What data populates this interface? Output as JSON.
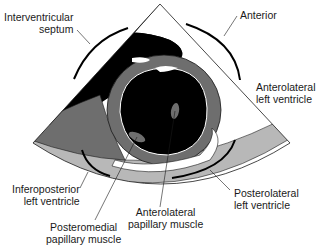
{
  "figure": {
    "type": "echocardiographic short-axis view of left ventricle at papillary muscle level",
    "labels": {
      "interventricular_septum_1": "Interventricular",
      "interventricular_septum_2": "septum",
      "anterior": "Anterior",
      "anterolateral_lv_1": "Anterolateral",
      "anterolateral_lv_2": "left ventricle",
      "inferoposterior_lv_1": "Inferoposterior",
      "inferoposterior_lv_2": "left ventricle",
      "posterolateral_lv_1": "Posterolateral",
      "posterolateral_lv_2": "left ventricle",
      "posteromedial_pm_1": "Posteromedial",
      "posteromedial_pm_2": "papillary muscle",
      "anterolateral_pm_1": "Anterolateral",
      "anterolateral_pm_2": "papillary muscle"
    },
    "colors": {
      "background": "#ffffff",
      "cavity": "#000000",
      "myocardium": "#6e6e6e",
      "pericardium_band": "#b8b8b8",
      "outline": "#1a1a1a"
    }
  }
}
